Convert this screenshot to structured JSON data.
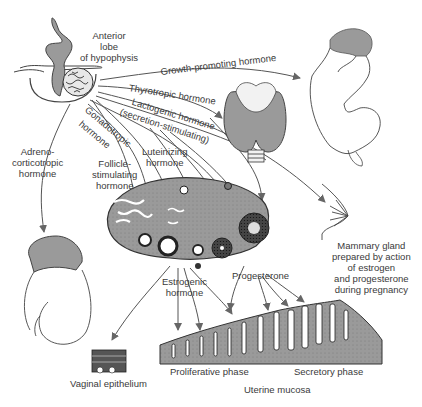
{
  "diagram": {
    "colors": {
      "tissue_fill": "#9a9a9a",
      "line": "#444444",
      "arrow": "#666666",
      "text": "#3a3a3a",
      "background": "#ffffff"
    },
    "source": {
      "label": "Anterior lobe of hypophysis",
      "lines": [
        "Anterior",
        "lobe",
        "of hypophysis"
      ]
    },
    "hormones": [
      {
        "id": "growth",
        "label": "Growth-promoting hormone",
        "target": "infant"
      },
      {
        "id": "thyrotropic",
        "label": "Thyrotropic hormone",
        "target": "thyroid gland"
      },
      {
        "id": "lactogenic",
        "label": "Lactogenic hormone",
        "sublabel": "(secretion-stimulating)",
        "target": "mammary gland"
      },
      {
        "id": "gonadotropic",
        "label": "Gonadotropic",
        "sublabel": "hormone",
        "target": "ovary"
      },
      {
        "id": "acth",
        "lines": [
          "Adreno-",
          "corticotropic",
          "hormone"
        ],
        "target": "adrenal gland"
      },
      {
        "id": "fsh",
        "lines": [
          "Follicle-",
          "stimulating",
          "hormone"
        ],
        "target": "ovary follicles"
      },
      {
        "id": "lh",
        "lines": [
          "Luteinizing",
          "hormone"
        ],
        "target": "corpus luteum"
      }
    ],
    "ovary_outputs": [
      {
        "id": "estrogenic",
        "lines": [
          "Estrogenic",
          "hormone"
        ]
      },
      {
        "id": "progesterone",
        "label": "Progesterone"
      }
    ],
    "targets": {
      "mammary": {
        "lines": [
          "Mammary gland",
          "prepared by action",
          "of estrogen",
          "and progesterone",
          "during pregnancy"
        ]
      },
      "vaginal": {
        "label": "Vaginal epithelium"
      },
      "uterine": {
        "label": "Uterine mucosa",
        "phases": [
          "Proliferative phase",
          "Secretory phase"
        ]
      }
    }
  }
}
